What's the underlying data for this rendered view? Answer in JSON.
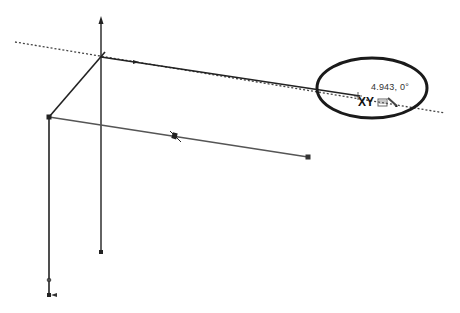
{
  "viewport": {
    "background": "#ffffff",
    "line_color": "#222222",
    "construction_line_color": "#444444",
    "highlight_circle_color": "#1a1a1a"
  },
  "sketch": {
    "axis_triad": {
      "origin": [
        101,
        57
      ],
      "vertical_axis_top": [
        101,
        18
      ],
      "vertical_axis_bottom": [
        101,
        252
      ],
      "diagonal_to": [
        49,
        117
      ]
    },
    "lines": [
      {
        "name": "top-line",
        "from": [
          101,
          57
        ],
        "to": [
          360,
          96
        ]
      },
      {
        "name": "left-vertical-line",
        "from": [
          49,
          117
        ],
        "to": [
          49,
          295
        ]
      },
      {
        "name": "middle-line",
        "from": [
          49,
          117
        ],
        "to": [
          308,
          157
        ]
      },
      {
        "name": "diagonal-line",
        "from": [
          101,
          57
        ],
        "to": [
          49,
          117
        ]
      }
    ],
    "construction_line": {
      "from": [
        15,
        42
      ],
      "to": [
        445,
        113
      ],
      "style": "dotted"
    },
    "endpoints": [
      [
        49,
        117
      ],
      [
        308,
        157
      ],
      [
        101,
        252
      ],
      [
        49,
        295
      ]
    ],
    "midpoint_marker": [
      175,
      137
    ]
  },
  "tooltip": {
    "value": "4.943, 0°",
    "plane": "XY",
    "icon": "sketch-relation-icon",
    "circle": {
      "cx": 372,
      "cy": 88,
      "rx": 55,
      "ry": 30
    }
  }
}
